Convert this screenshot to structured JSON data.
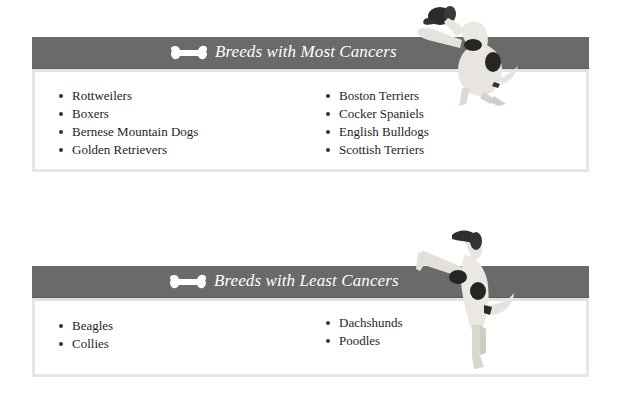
{
  "sections": [
    {
      "title": "Breeds with Most Cancers",
      "icon": "bone-icon",
      "left_column": [
        "Rottweilers",
        "Boxers",
        "Bernese Mountain Dogs",
        "Golden Retrievers"
      ],
      "right_column": [
        "Boston Terriers",
        "Cocker Spaniels",
        "English Bulldogs",
        "Scottish Terriers"
      ]
    },
    {
      "title": "Breeds with Least Cancers",
      "icon": "bone-icon",
      "left_column": [
        "Beagles",
        "Collies"
      ],
      "right_column": [
        "Dachshunds",
        "Poodles"
      ]
    }
  ],
  "colors": {
    "banner": "#6a6a6a",
    "banner_text": "#ffffff",
    "box_border": "#e6e6e6"
  }
}
